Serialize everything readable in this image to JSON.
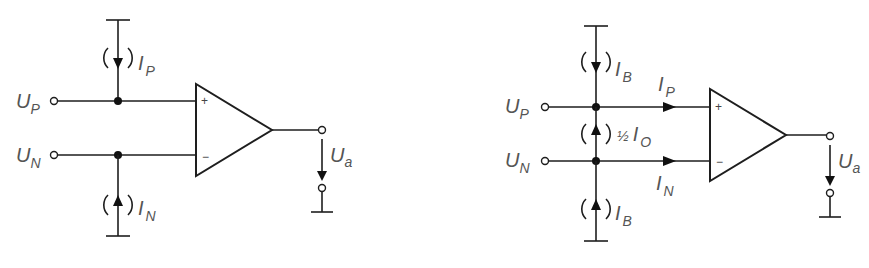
{
  "figure": {
    "left_circuit": {
      "title": "Bias currents modeled as independent sources",
      "inputs": {
        "noninverting": {
          "symbol": "U",
          "subscript": "P"
        },
        "inverting": {
          "symbol": "U",
          "subscript": "N"
        }
      },
      "sources": {
        "top": {
          "symbol": "I",
          "subscript": "P",
          "direction": "down"
        },
        "bottom": {
          "symbol": "I",
          "subscript": "N",
          "direction": "up"
        }
      },
      "opamp": {
        "plus": "+",
        "minus": "−"
      },
      "output": {
        "symbol": "U",
        "subscript": "a"
      }
    },
    "right_circuit": {
      "title": "Bias current and offset current model",
      "inputs": {
        "noninverting": {
          "symbol": "U",
          "subscript": "P"
        },
        "inverting": {
          "symbol": "U",
          "subscript": "N"
        }
      },
      "sources": {
        "top": {
          "symbol": "I",
          "subscript": "B",
          "direction": "down"
        },
        "middle": {
          "prefix": "½",
          "symbol": "I",
          "subscript": "O",
          "direction": "up"
        },
        "bottom": {
          "symbol": "I",
          "subscript": "B",
          "direction": "up"
        }
      },
      "branch_currents": {
        "p": {
          "symbol": "I",
          "subscript": "P"
        },
        "n": {
          "symbol": "I",
          "subscript": "N"
        }
      },
      "opamp": {
        "plus": "+",
        "minus": "−"
      },
      "output": {
        "symbol": "U",
        "subscript": "a"
      }
    },
    "colors": {
      "line": "#1e1e1e",
      "text": "#555555",
      "background": "#ffffff"
    }
  }
}
